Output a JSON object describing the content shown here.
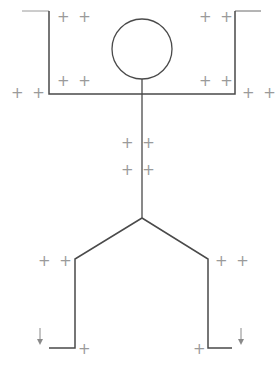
{
  "diagram": {
    "type": "stick-figure-marker-diagram",
    "stroke_color": "#4a4a4a",
    "marker_color": "#9a9a9a",
    "markers": [
      {
        "id": "top-left-upper",
        "label": "+ +"
      },
      {
        "id": "top-right-upper",
        "label": "+ +"
      },
      {
        "id": "top-left-lower",
        "label": "+ +"
      },
      {
        "id": "top-right-lower",
        "label": "+ +"
      },
      {
        "id": "outer-left",
        "label": "+ +"
      },
      {
        "id": "outer-right",
        "label": "+ +"
      },
      {
        "id": "torso-upper",
        "label": "+ +"
      },
      {
        "id": "torso-lower",
        "label": "+ +"
      },
      {
        "id": "knee-left",
        "label": "+ +"
      },
      {
        "id": "knee-right",
        "label": "+ +"
      },
      {
        "id": "foot-left",
        "label": "+"
      },
      {
        "id": "foot-right",
        "label": "+"
      }
    ],
    "arrows": [
      {
        "id": "arrow-left",
        "glyph": "↓"
      },
      {
        "id": "arrow-right",
        "glyph": "↓"
      }
    ]
  }
}
